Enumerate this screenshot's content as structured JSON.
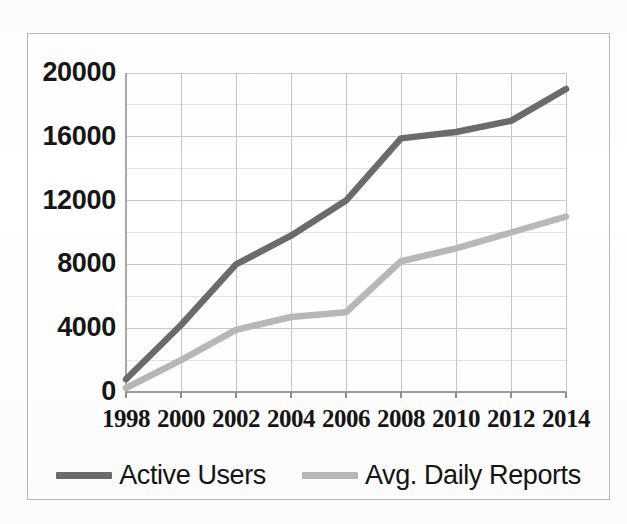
{
  "chart_data": {
    "type": "line",
    "title": "",
    "subtitle": "",
    "xlabel": "",
    "ylabel": "",
    "x": [
      1998,
      2000,
      2002,
      2004,
      2006,
      2008,
      2010,
      2012,
      2014
    ],
    "xtick_labels": [
      "1998",
      "2000",
      "2002",
      "2004",
      "2006",
      "2008",
      "2010",
      "2012",
      "2014"
    ],
    "ytick_labels": [
      "0",
      "4000",
      "8000",
      "12000",
      "16000",
      "20000"
    ],
    "ytick_values": [
      0,
      4000,
      8000,
      12000,
      16000,
      20000
    ],
    "xlim": [
      1998,
      2014
    ],
    "ylim": [
      0,
      20000
    ],
    "grid": "both-major-and-minor",
    "minor_ytick_values": [
      2000,
      6000,
      10000,
      14000,
      18000
    ],
    "legend_position": "bottom-center",
    "series": [
      {
        "name": "Active Users",
        "color": "#6b6b6b",
        "values": [
          800,
          4200,
          8000,
          9800,
          12000,
          15900,
          16300,
          17000,
          19000
        ]
      },
      {
        "name": "Avg. Daily Reports",
        "color": "#b8b8b8",
        "values": [
          250,
          2000,
          3900,
          4700,
          5000,
          8200,
          9000,
          10000,
          11000
        ]
      }
    ]
  },
  "legend": {
    "entries": [
      {
        "label": "Active Users",
        "swatch_color": "#6b6b6b"
      },
      {
        "label": "Avg. Daily Reports",
        "swatch_color": "#b8b8b8"
      }
    ]
  },
  "axes": {
    "y_labels": [
      "20000",
      "16000",
      "12000",
      "8000",
      "4000",
      "0"
    ],
    "x_labels": [
      "1998",
      "2000",
      "2002",
      "2004",
      "2006",
      "2008",
      "2010",
      "2012",
      "2014"
    ]
  },
  "style": {
    "frame_color": "#b9b9b9",
    "gridline_color": "#c9c9c9",
    "minor_gridline_color": "#e2e2e2",
    "axis_color": "#9a9a9a",
    "background": "#ffffff"
  }
}
